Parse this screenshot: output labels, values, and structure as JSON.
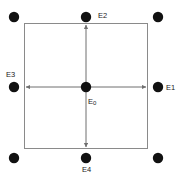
{
  "figure": {
    "width": 179,
    "height": 178,
    "background_color": "#ffffff",
    "line_color": "#8a8a8a",
    "arrow_color": "#6f6f6f",
    "dot_color": "#111111",
    "text_color": "#1a1a1a",
    "labels": {
      "center": "E",
      "center_sub": "0",
      "right": "E1",
      "top": "E2",
      "left": "E3",
      "bottom": "E4"
    },
    "rectangle": {
      "x": 24,
      "y": 23,
      "width": 124,
      "height": 126
    },
    "nodes": [
      {
        "name": "center-node",
        "label": "E0",
        "cx": 86,
        "cy": 87,
        "r": 5.2
      },
      {
        "name": "top-node",
        "label": "E2",
        "cx": 86,
        "cy": 17,
        "r": 5.2
      },
      {
        "name": "right-node",
        "label": "E1",
        "cx": 158,
        "cy": 87,
        "r": 5.2
      },
      {
        "name": "left-node",
        "label": "E3",
        "cx": 14,
        "cy": 87,
        "r": 5.2
      },
      {
        "name": "bottom-node",
        "label": "E4",
        "cx": 86,
        "cy": 158,
        "r": 5.2
      },
      {
        "name": "corner-node-tl",
        "label": "",
        "cx": 14,
        "cy": 17,
        "r": 5.2
      },
      {
        "name": "corner-node-tr",
        "label": "",
        "cx": 158,
        "cy": 17,
        "r": 5.2
      },
      {
        "name": "corner-node-bl",
        "label": "",
        "cx": 14,
        "cy": 158,
        "r": 5.2
      },
      {
        "name": "corner-node-br",
        "label": "",
        "cx": 158,
        "cy": 158,
        "r": 5.2
      }
    ],
    "arrows": [
      {
        "name": "arrow-up",
        "x1": 86,
        "y1": 87,
        "x2": 86,
        "y2": 24
      },
      {
        "name": "arrow-down",
        "x1": 86,
        "y1": 87,
        "x2": 86,
        "y2": 148
      },
      {
        "name": "arrow-left",
        "x1": 86,
        "y1": 87,
        "x2": 25,
        "y2": 87
      },
      {
        "name": "arrow-right",
        "x1": 86,
        "y1": 87,
        "x2": 147,
        "y2": 87
      }
    ]
  }
}
